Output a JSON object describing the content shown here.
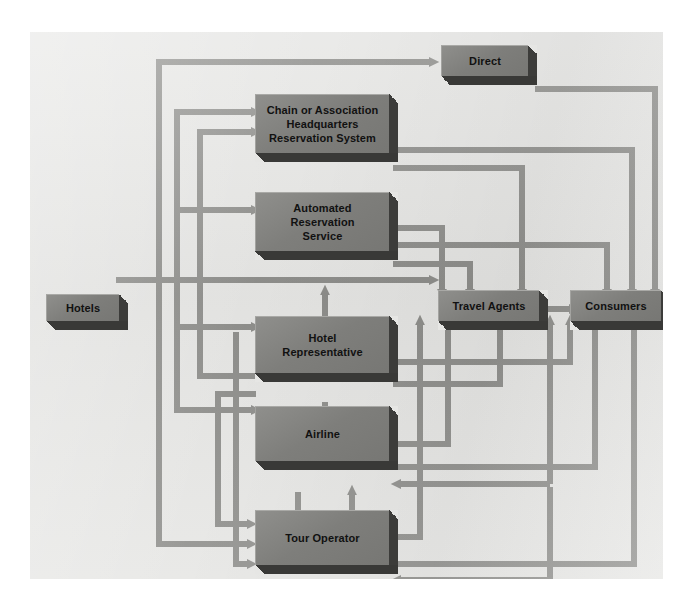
{
  "figure": {
    "background_color": "#e6e6e4",
    "node_face_color": "#80807d",
    "node_shadow_color": "#3a3a38",
    "arrow_color": "#8e8e8b",
    "text_color": "#111111"
  },
  "nodes": [
    {
      "id": "hotels",
      "label": "Hotels"
    },
    {
      "id": "direct",
      "label": "Direct"
    },
    {
      "id": "chain",
      "label": "Chain or Association\nHeadquarters\nReservation System",
      "lines": [
        "Chain or Association",
        "Headquarters",
        "Reservation System"
      ]
    },
    {
      "id": "automated",
      "label": "Automated\nReservation\nService",
      "lines": [
        "Automated",
        "Reservation",
        "Service"
      ]
    },
    {
      "id": "hotelrep",
      "label": "Hotel\nRepresentative",
      "lines": [
        "Hotel",
        "Representative"
      ]
    },
    {
      "id": "airline",
      "label": "Airline",
      "lines": [
        "Airline"
      ]
    },
    {
      "id": "touroperator",
      "label": "Tour Operator",
      "lines": [
        "Tour Operator"
      ]
    },
    {
      "id": "travelagents",
      "label": "Travel Agents",
      "lines": [
        "Travel Agents"
      ]
    },
    {
      "id": "consumers",
      "label": "Consumers",
      "lines": [
        "Consumers"
      ]
    }
  ],
  "node_labels": {
    "hotels": "Hotels",
    "direct": "Direct",
    "chain_l1": "Chain or Association",
    "chain_l2": "Headquarters",
    "chain_l3": "Reservation System",
    "automated_l1": "Automated",
    "automated_l2": "Reservation",
    "automated_l3": "Service",
    "hotelrep_l1": "Hotel",
    "hotelrep_l2": "Representative",
    "airline": "Airline",
    "touroperator": "Tour Operator",
    "travelagents": "Travel Agents",
    "consumers": "Consumers"
  },
  "edges": [
    {
      "from": "hotels",
      "to": "direct"
    },
    {
      "from": "hotels",
      "to": "chain"
    },
    {
      "from": "hotels",
      "to": "automated"
    },
    {
      "from": "hotels",
      "to": "hotelrep"
    },
    {
      "from": "hotels",
      "to": "airline"
    },
    {
      "from": "hotels",
      "to": "touroperator"
    },
    {
      "from": "hotels",
      "to": "travelagents"
    },
    {
      "from": "chain",
      "to": "automated"
    },
    {
      "from": "chain",
      "to": "travelagents"
    },
    {
      "from": "chain",
      "to": "consumers"
    },
    {
      "from": "automated",
      "to": "travelagents"
    },
    {
      "from": "automated",
      "to": "consumers"
    },
    {
      "from": "hotelrep",
      "to": "airline"
    },
    {
      "from": "hotelrep",
      "to": "travelagents"
    },
    {
      "from": "hotelrep",
      "to": "consumers"
    },
    {
      "from": "hotelrep",
      "to": "chain"
    },
    {
      "from": "airline",
      "to": "touroperator"
    },
    {
      "from": "airline",
      "to": "travelagents"
    },
    {
      "from": "airline",
      "to": "consumers"
    },
    {
      "from": "touroperator",
      "to": "airline"
    },
    {
      "from": "touroperator",
      "to": "travelagents"
    },
    {
      "from": "touroperator",
      "to": "consumers"
    },
    {
      "from": "direct",
      "to": "consumers"
    },
    {
      "from": "travelagents",
      "to": "consumers"
    },
    {
      "from": "consumers",
      "to": "airline"
    },
    {
      "from": "consumers",
      "to": "touroperator"
    }
  ]
}
